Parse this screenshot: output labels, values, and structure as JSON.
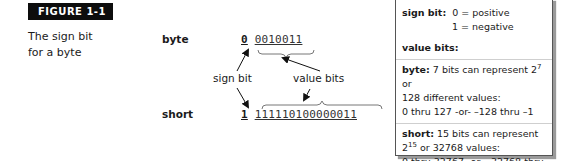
{
  "figure": {
    "label": "FIGURE 1-1",
    "caption_line1": "The sign bit",
    "caption_line2": "for a byte"
  },
  "diagram": {
    "byte": {
      "label": "byte",
      "sign_bit": "0",
      "value_bits": "0010011"
    },
    "short": {
      "label": "short",
      "sign_bit": "1",
      "value_bits": "111110100000011"
    },
    "annotations": {
      "sign_bit": "sign bit",
      "value_bits": "value bits"
    }
  },
  "panel": {
    "sign_bit": {
      "title": "sign bit:",
      "line1": "0 = positive",
      "line2": "1 = negative"
    },
    "value_bits_title": "value bits:",
    "byte": {
      "title": "byte:",
      "text_a": "7 bits can represent 2",
      "exp": "7",
      "text_b": " or",
      "line2": "128 different values:",
      "line3": "0 thru 127 -or- –128 thru –1"
    },
    "short": {
      "title": "short:",
      "text_a": "15 bits can represent",
      "base": "2",
      "exp": "15",
      "text_b": " or 32768 values:",
      "line3": "0 thru 32767 -or- –32768 thru –1"
    }
  }
}
